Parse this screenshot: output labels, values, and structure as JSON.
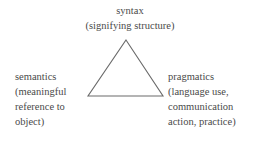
{
  "diagram": {
    "background_color": "#ffffff",
    "text_color": "#4a4a4a",
    "line_color": "#6a6a6a",
    "shape": {
      "name": "triangle",
      "apex": {
        "x": 126,
        "y": 40
      },
      "bottom_left": {
        "x": 88,
        "y": 96
      },
      "bottom_right": {
        "x": 163,
        "y": 96
      }
    },
    "vertices": [
      {
        "id": "syntax",
        "position": "top",
        "lines": [
          "syntax",
          "(signifying structure)"
        ]
      },
      {
        "id": "semantics",
        "position": "bottom-left",
        "lines": [
          "semantics",
          "(meaningful",
          "reference to",
          "object)"
        ]
      },
      {
        "id": "pragmatics",
        "position": "bottom-right",
        "lines": [
          "pragmatics",
          "(language use,",
          "communication",
          "action, practice)"
        ]
      }
    ]
  }
}
